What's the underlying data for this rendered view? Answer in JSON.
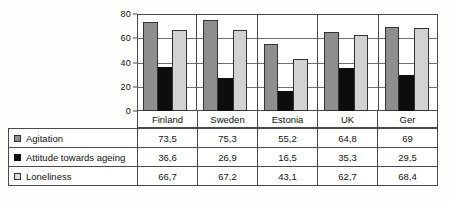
{
  "chart_data": {
    "type": "bar",
    "title": "",
    "subtitle": "",
    "xlabel": "",
    "ylabel": "",
    "ylim": [
      0,
      80
    ],
    "yticks": [
      0,
      20,
      40,
      60,
      80
    ],
    "ytick_labels": [
      "0",
      "20",
      "40",
      "60",
      "80"
    ],
    "grid": true,
    "legend_position": "table-left",
    "categories": [
      "Finland",
      "Sweden",
      "Estonia",
      "UK",
      "Ger"
    ],
    "series": [
      {
        "name": "Agitation",
        "color": "#8e8e8e",
        "swatch": "gray-swatch",
        "values": [
          73.5,
          75.3,
          55.2,
          64.8,
          69
        ],
        "labels": [
          "73,5",
          "75,3",
          "55,2",
          "64,8",
          "69"
        ]
      },
      {
        "name": "Attitude towards ageing",
        "color": "#0d0d0d",
        "swatch": "black-swatch",
        "values": [
          36.6,
          26.9,
          16.5,
          35.3,
          29.5
        ],
        "labels": [
          "36,6",
          "26,9",
          "16,5",
          "35,3",
          "29,5"
        ]
      },
      {
        "name": "Loneliness",
        "color": "#d2d2d2",
        "swatch": "light-gray-swatch",
        "values": [
          66.7,
          67.2,
          43.1,
          62.7,
          68.4
        ],
        "labels": [
          "66,7",
          "67,2",
          "43,1",
          "62,7",
          "68,4"
        ]
      }
    ]
  }
}
